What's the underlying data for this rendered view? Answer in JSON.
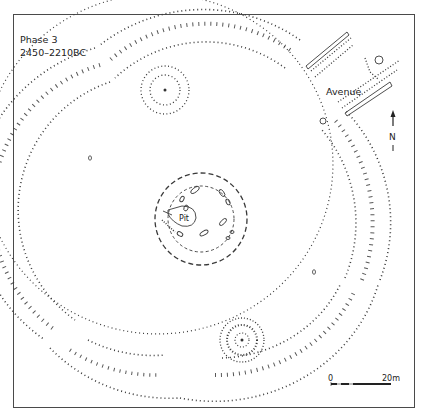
{
  "title": {
    "phase": "Phase 3",
    "date_range": "2450–2210BC"
  },
  "labels": {
    "avenue": "Avenue",
    "pit": "Pit",
    "north": "N"
  },
  "scale_bar": {
    "start": "0",
    "end": "20m"
  },
  "colors": {
    "ink": "#333333",
    "frame": "#4a4a4a",
    "background": "#ffffff"
  }
}
